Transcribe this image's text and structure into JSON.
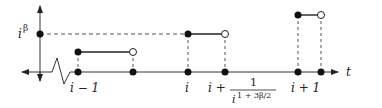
{
  "diagram": {
    "y_label": "i",
    "y_label_sup": "β",
    "x_axis_label": "t",
    "tick_labels": {
      "i_minus_1": "i − 1",
      "i": "i",
      "i_plus_frac_prefix": "i +",
      "frac_num": "1",
      "frac_den_base": "i",
      "frac_den_exp": "1 + 3β/2",
      "i_plus_1": "i + 1"
    },
    "colors": {
      "line": "#222222",
      "dashed": "#555555",
      "dot_fill": "#111111",
      "open_fill": "#ffffff"
    }
  }
}
